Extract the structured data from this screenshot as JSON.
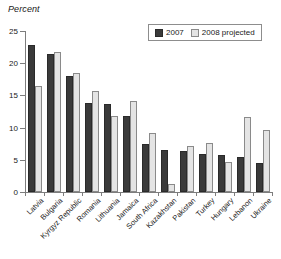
{
  "chart_data": {
    "type": "bar",
    "title": "",
    "ylabel": "Percent",
    "xlabel": "",
    "ylim": [
      0,
      25
    ],
    "yticks": [
      0,
      5,
      10,
      15,
      20,
      25
    ],
    "grid": false,
    "legend_position": "top-right",
    "categories": [
      "Latvia",
      "Bulgaria",
      "Kyrgyz Republic",
      "Romania",
      "Lithuania",
      "Jamaica",
      "South Africa",
      "Kazakhstan",
      "Pakistan",
      "Turkey",
      "Hungary",
      "Lebanon",
      "Ukraine"
    ],
    "series": [
      {
        "name": "2007",
        "color": "#3a3a3a",
        "values": [
          22.8,
          21.5,
          18.0,
          13.8,
          13.7,
          11.8,
          7.5,
          6.5,
          6.3,
          5.9,
          5.8,
          5.5,
          4.5
        ]
      },
      {
        "name": "2008 projected",
        "color": "#e4e4e4",
        "values": [
          16.4,
          21.8,
          18.5,
          15.7,
          11.8,
          14.1,
          9.1,
          1.2,
          7.2,
          7.6,
          4.6,
          11.6,
          9.7
        ]
      }
    ]
  },
  "legend": {
    "items": [
      {
        "label": "2007",
        "swatch": "dark-swatch"
      },
      {
        "label": "2008 projected",
        "swatch": "light-swatch"
      }
    ]
  },
  "axis": {
    "y_title": "Percent"
  }
}
